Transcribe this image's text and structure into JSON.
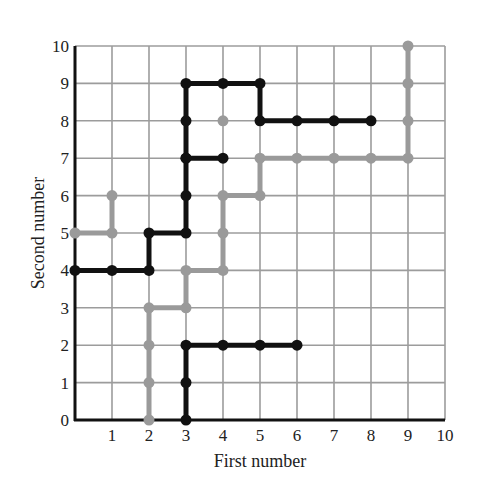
{
  "chart_data": {
    "type": "line",
    "title": "",
    "xlabel": "First number",
    "ylabel": "Second number",
    "xlim": [
      0,
      10
    ],
    "ylim": [
      0,
      10
    ],
    "x_ticks": [
      "1",
      "2",
      "3",
      "4",
      "5",
      "6",
      "7",
      "8",
      "9",
      "10"
    ],
    "y_ticks": [
      "0",
      "1",
      "2",
      "3",
      "4",
      "5",
      "6",
      "7",
      "8",
      "9",
      "10"
    ],
    "grid": true,
    "legend": null,
    "series": [
      {
        "name": "black-path-upper",
        "color": "#111111",
        "points": [
          [
            0,
            4
          ],
          [
            1,
            4
          ],
          [
            2,
            4
          ],
          [
            2,
            5
          ],
          [
            3,
            5
          ],
          [
            3,
            6
          ],
          [
            3,
            7
          ],
          [
            3,
            8
          ],
          [
            3,
            9
          ],
          [
            4,
            9
          ],
          [
            5,
            9
          ],
          [
            5,
            8
          ],
          [
            6,
            8
          ],
          [
            7,
            8
          ],
          [
            8,
            8
          ]
        ],
        "branches": [
          [
            [
              3,
              7
            ],
            [
              4,
              7
            ]
          ]
        ]
      },
      {
        "name": "black-path-lower",
        "color": "#111111",
        "points": [
          [
            3,
            0
          ],
          [
            3,
            1
          ],
          [
            3,
            2
          ],
          [
            4,
            2
          ],
          [
            5,
            2
          ],
          [
            6,
            2
          ]
        ],
        "branches": []
      },
      {
        "name": "gray-path-left",
        "color": "#9a9a9a",
        "points": [
          [
            0,
            5
          ],
          [
            1,
            5
          ],
          [
            1,
            6
          ]
        ],
        "branches": []
      },
      {
        "name": "gray-path-main",
        "color": "#9a9a9a",
        "points": [
          [
            2,
            0
          ],
          [
            2,
            1
          ],
          [
            2,
            2
          ],
          [
            2,
            3
          ],
          [
            3,
            3
          ],
          [
            3,
            4
          ],
          [
            4,
            4
          ],
          [
            4,
            5
          ],
          [
            4,
            6
          ],
          [
            5,
            6
          ],
          [
            5,
            7
          ],
          [
            6,
            7
          ],
          [
            7,
            7
          ],
          [
            8,
            7
          ],
          [
            9,
            7
          ],
          [
            9,
            8
          ],
          [
            9,
            9
          ],
          [
            9,
            10
          ]
        ],
        "branches": []
      },
      {
        "name": "gray-isolated-point",
        "color": "#9a9a9a",
        "points": [
          [
            4,
            8
          ]
        ],
        "branches": []
      }
    ]
  },
  "layout": {
    "origin_px": [
      75,
      420
    ],
    "unit_px": [
      37.0,
      37.4
    ],
    "grid_color": "#9c9c9c",
    "axis_color": "#111111"
  }
}
